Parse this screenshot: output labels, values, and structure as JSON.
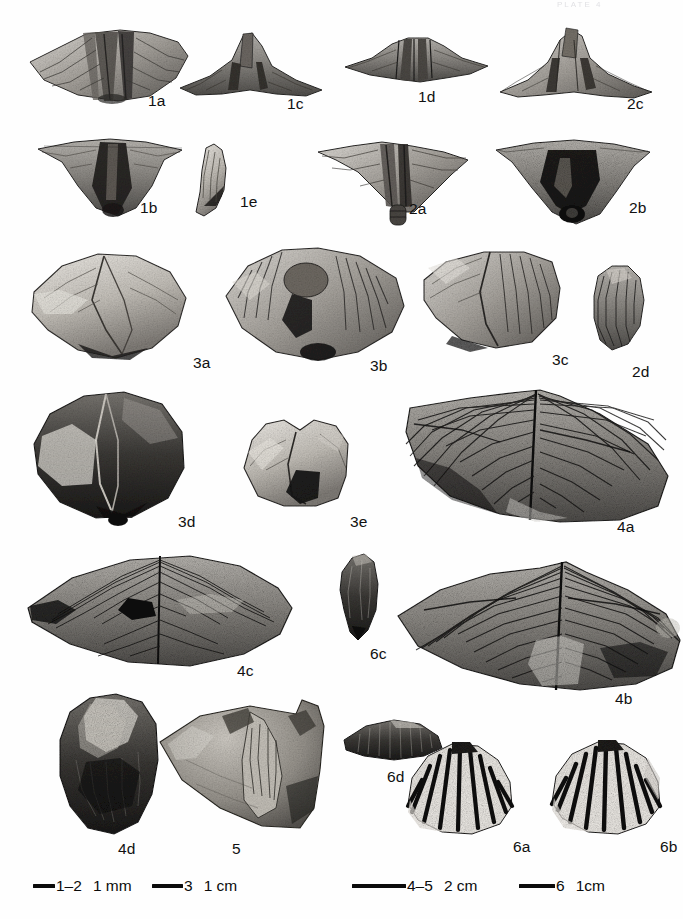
{
  "plate": {
    "running_header": "PLATE 4",
    "background_color": "#fefefe",
    "ink_color": "#111111",
    "width": 683,
    "height": 919
  },
  "figures": [
    {
      "label": "1a",
      "x": 148,
      "y": 92,
      "shape": "spiriferid-ventral-wide",
      "row": 1
    },
    {
      "label": "1c",
      "x": 287,
      "y": 95,
      "shape": "spiriferid-anterior",
      "row": 1
    },
    {
      "label": "1d",
      "x": 418,
      "y": 88,
      "shape": "spiriferid-posterior",
      "row": 1
    },
    {
      "label": "2c",
      "x": 627,
      "y": 95,
      "shape": "spiriferid-anterior-wide",
      "row": 1
    },
    {
      "label": "1b",
      "x": 140,
      "y": 199,
      "shape": "spiriferid-dorsal",
      "row": 2
    },
    {
      "label": "1e",
      "x": 240,
      "y": 193,
      "shape": "valve-profile-crescent",
      "row": 2
    },
    {
      "label": "2a",
      "x": 409,
      "y": 200,
      "shape": "spiriferid-ventral-beak",
      "row": 2
    },
    {
      "label": "2b",
      "x": 629,
      "y": 199,
      "shape": "spiriferid-interior",
      "row": 2
    },
    {
      "label": "3a",
      "x": 193,
      "y": 354,
      "shape": "rhomboid-smooth-dorsal",
      "row": 3
    },
    {
      "label": "3b",
      "x": 370,
      "y": 357,
      "shape": "rhomboid-costate-ventral",
      "row": 3
    },
    {
      "label": "3c",
      "x": 552,
      "y": 351,
      "shape": "rhomboid-costate-lateral",
      "row": 3
    },
    {
      "label": "2d",
      "x": 632,
      "y": 363,
      "shape": "valve-profile-ribbed",
      "row": 3
    },
    {
      "label": "3d",
      "x": 178,
      "y": 513,
      "shape": "rhomboid-smooth-ventral",
      "row": 4
    },
    {
      "label": "3e",
      "x": 350,
      "y": 513,
      "shape": "rhomboid-lateral-block",
      "row": 4
    },
    {
      "label": "4a",
      "x": 617,
      "y": 518,
      "shape": "large-spiriferid-fan",
      "row": 4
    },
    {
      "label": "4c",
      "x": 237,
      "y": 662,
      "shape": "large-spiriferid-lenticular",
      "row": 5
    },
    {
      "label": "6c",
      "x": 370,
      "y": 645,
      "shape": "small-elongate-valve",
      "row": 5
    },
    {
      "label": "4b",
      "x": 615,
      "y": 690,
      "shape": "large-spiriferid-fan-wide",
      "row": 5
    },
    {
      "label": "4d",
      "x": 118,
      "y": 840,
      "shape": "ovate-valve-dark",
      "row": 6
    },
    {
      "label": "5",
      "x": 232,
      "y": 840,
      "shape": "rock-slab-fragment",
      "row": 6
    },
    {
      "label": "6d",
      "x": 387,
      "y": 768,
      "shape": "lenticular-ribbed-profile",
      "row": 6
    },
    {
      "label": "6a",
      "x": 513,
      "y": 838,
      "shape": "ribbed-brachiopod",
      "row": 6
    },
    {
      "label": "6b",
      "x": 660,
      "y": 838,
      "shape": "ribbed-brachiopod",
      "row": 6
    }
  ],
  "scale_bars": [
    {
      "id": "1–2",
      "unit": "1 mm",
      "bar_px": 22,
      "x": 33
    },
    {
      "id": "3",
      "unit": "1 cm",
      "bar_px": 31,
      "x": 152
    },
    {
      "id": "4–5",
      "unit": "2 cm",
      "bar_px": 54,
      "x": 352
    },
    {
      "id": "6",
      "unit": "1cm",
      "bar_px": 36,
      "x": 519
    }
  ]
}
